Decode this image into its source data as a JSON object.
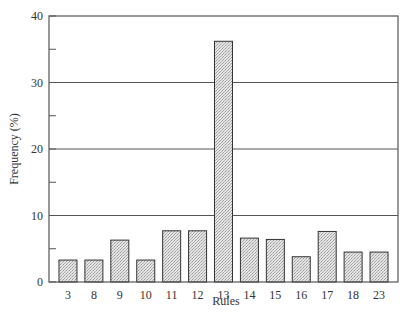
{
  "chart_data": {
    "type": "bar",
    "title": "",
    "xlabel": "Rules",
    "ylabel": "Frequency (%)",
    "categories": [
      "3",
      "8",
      "9",
      "10",
      "11",
      "12",
      "13",
      "14",
      "15",
      "16",
      "17",
      "18",
      "23"
    ],
    "values": [
      3.3,
      3.3,
      6.3,
      3.3,
      7.7,
      7.7,
      36.2,
      6.6,
      6.4,
      3.8,
      7.6,
      4.5,
      4.5
    ],
    "ylim": [
      0,
      40
    ],
    "yticks": [
      0,
      10,
      20,
      30,
      40
    ],
    "yminor_ticks": [
      5,
      15,
      25,
      35
    ],
    "grid": {
      "horizontal": true,
      "at": [
        10,
        20,
        30
      ]
    },
    "legend": null,
    "colors": {
      "bar_fill": "#d9d9d9",
      "bar_edge": "#333333",
      "axis": "#555555"
    }
  }
}
